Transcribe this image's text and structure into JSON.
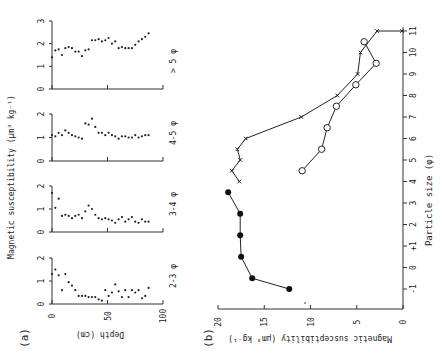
{
  "figure": {
    "panel_a_label": "(a)",
    "panel_b_label": "(b)"
  },
  "chart_data": [
    {
      "panel": "(a)",
      "type": "scatter",
      "title": "",
      "xlabel": "Depth (cm)",
      "ylabel": "Magnetic susceptibility (µm³ kg⁻¹)",
      "x_ticks": [
        0,
        50,
        100
      ],
      "xlim": [
        0,
        100
      ],
      "grid": false,
      "subplots": [
        {
          "name": "> 5 φ",
          "ylim": [
            0,
            3
          ],
          "y_ticks": [
            0,
            1,
            2,
            3
          ],
          "x": [
            0,
            3,
            6,
            9,
            12,
            15,
            18,
            21,
            24,
            27,
            30,
            33,
            36,
            39,
            42,
            45,
            48,
            51,
            54,
            57,
            60,
            63,
            66,
            69,
            72,
            75,
            78,
            81,
            84,
            87
          ],
          "values": [
            1.4,
            1.7,
            1.75,
            1.5,
            1.8,
            1.85,
            1.8,
            1.65,
            1.65,
            1.45,
            1.7,
            1.75,
            2.15,
            2.15,
            2.2,
            2.1,
            2.15,
            2.25,
            2.0,
            2.1,
            1.8,
            1.85,
            1.8,
            1.8,
            1.8,
            1.95,
            2.1,
            2.2,
            2.3,
            2.45
          ]
        },
        {
          "name": "4-5 φ",
          "ylim": [
            0,
            2
          ],
          "y_ticks": [
            0,
            1,
            2
          ],
          "x": [
            0,
            3,
            6,
            9,
            12,
            15,
            18,
            21,
            24,
            27,
            30,
            33,
            36,
            39,
            42,
            45,
            48,
            51,
            54,
            57,
            60,
            63,
            66,
            69,
            72,
            75,
            78,
            81,
            84,
            87
          ],
          "values": [
            1.1,
            1.05,
            1.2,
            1.1,
            1.3,
            1.2,
            1.1,
            1.05,
            1.0,
            0.95,
            1.6,
            1.55,
            1.8,
            1.45,
            1.2,
            1.2,
            1.1,
            1.2,
            1.1,
            1.05,
            0.95,
            1.05,
            1.05,
            1.0,
            1.0,
            1.1,
            1.0,
            1.05,
            1.1,
            1.1
          ]
        },
        {
          "name": "3-4 φ",
          "ylim": [
            0,
            2
          ],
          "y_ticks": [
            0,
            1,
            2
          ],
          "x": [
            0,
            3,
            6,
            9,
            12,
            15,
            18,
            21,
            24,
            27,
            30,
            33,
            36,
            39,
            42,
            45,
            48,
            51,
            54,
            57,
            60,
            63,
            66,
            69,
            72,
            75,
            78,
            81,
            84,
            87
          ],
          "values": [
            1.7,
            1.05,
            1.45,
            0.7,
            0.75,
            0.7,
            0.6,
            0.7,
            0.75,
            0.6,
            0.9,
            1.15,
            1.0,
            0.75,
            0.6,
            0.55,
            0.6,
            0.55,
            0.5,
            0.4,
            0.55,
            0.65,
            0.45,
            0.55,
            0.65,
            0.45,
            0.4,
            0.55,
            0.45,
            0.45
          ]
        },
        {
          "name": "2-3 φ",
          "ylim": [
            0,
            2
          ],
          "y_ticks": [
            0,
            1,
            2
          ],
          "x": [
            0,
            3,
            6,
            9,
            12,
            15,
            18,
            21,
            24,
            27,
            30,
            33,
            36,
            39,
            42,
            45,
            48,
            51,
            54,
            57,
            60,
            63,
            66,
            69,
            72,
            75,
            78,
            81,
            84,
            87
          ],
          "values": [
            1.3,
            1.5,
            1.25,
            0.6,
            1.3,
            0.95,
            0.8,
            0.6,
            0.35,
            0.35,
            0.35,
            0.3,
            0.3,
            0.3,
            0.2,
            0.15,
            0.6,
            0.35,
            0.5,
            0.85,
            0.55,
            0.3,
            0.6,
            0.3,
            0.6,
            0.5,
            0.6,
            0.25,
            0.35,
            0.7
          ]
        }
      ]
    },
    {
      "panel": "(b)",
      "type": "line",
      "title": "",
      "xlabel": "Particle size (φ)",
      "ylabel": "Magnetic susceptibility (µm³ kg⁻¹)",
      "x_ticks": [
        "-1",
        "0",
        "+1",
        "2",
        "3",
        "4",
        "5",
        "6",
        "7",
        "8",
        "9",
        "10",
        "11"
      ],
      "xlim": [
        -1.9,
        11
      ],
      "ylim": [
        0,
        20
      ],
      "y_ticks": [
        0,
        5,
        10,
        15,
        20
      ],
      "grid": false,
      "legend": "none (markers distinguish series)",
      "series": [
        {
          "name": "filled-circle series",
          "marker": "filled-circle",
          "x": [
            -1,
            -0.5,
            0.5,
            1.5,
            2.5,
            3.5
          ],
          "values": [
            12.3,
            16.3,
            17.5,
            17.6,
            17.6,
            18.9
          ]
        },
        {
          "name": "cross series",
          "marker": "x",
          "x": [
            4,
            4.5,
            5,
            5.5,
            6,
            7,
            8,
            9,
            10,
            11,
            11
          ],
          "values": [
            17.7,
            18.5,
            17.6,
            17.9,
            17.0,
            11.0,
            7.1,
            4.9,
            4.6,
            2.8,
            0.1
          ]
        },
        {
          "name": "open-circle series",
          "marker": "open-circle",
          "x": [
            4.5,
            5.5,
            6.5,
            7.5,
            8.5,
            9.5,
            10.5
          ],
          "values": [
            10.9,
            8.8,
            8.2,
            7.2,
            5.1,
            2.9,
            4.2
          ]
        }
      ]
    }
  ]
}
